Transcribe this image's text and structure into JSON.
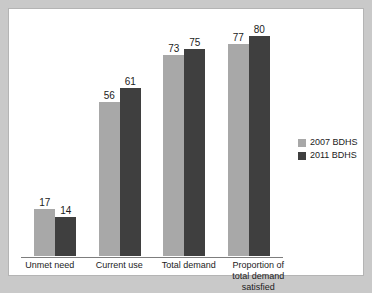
{
  "chart_data": {
    "type": "bar",
    "title": "",
    "subtitle": "",
    "xlabel": "",
    "ylabel": "",
    "ylim": [
      0,
      82
    ],
    "grid": false,
    "legend_position": "right",
    "categories": [
      "Unmet need",
      "Current use",
      "Total demand",
      "Proportion of total demand satisfied"
    ],
    "series": [
      {
        "name": "2007 BDHS",
        "color": "#a8a8a8",
        "values": [
          17,
          56,
          73,
          77
        ]
      },
      {
        "name": "2011 BDHS",
        "color": "#3f3f3f",
        "values": [
          14,
          61,
          75,
          80
        ]
      }
    ]
  },
  "legend": {
    "items": [
      {
        "label": "2007 BDHS",
        "color": "#a8a8a8"
      },
      {
        "label": "2011 BDHS",
        "color": "#3f3f3f"
      }
    ]
  },
  "colors": {
    "page_background": "#c9c9c9",
    "figure_background": "#ffffff",
    "axis_line": "#7d7d7d",
    "text": "#1c1c1c"
  }
}
